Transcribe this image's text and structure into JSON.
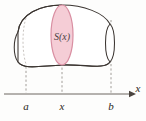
{
  "figure": {
    "type": "solid-cross-section-diagram",
    "caption_labels": {
      "cross_section": "S(x)",
      "axis": "x"
    },
    "axis": {
      "name": "x-axis",
      "label": "x",
      "tick_labels": [
        "a",
        "x",
        "b"
      ],
      "tick_positions_px": [
        26,
        62,
        111
      ],
      "y_px": 94,
      "x_start_px": 4,
      "x_end_px": 133,
      "arrow": "right-arrow"
    },
    "solid": {
      "name": "solid-body",
      "outline_color": "#3b3531",
      "fill_color": "#ffffff",
      "left_cap_hidden": true,
      "right_cap_visible": true
    },
    "cross_section": {
      "name": "cross-section-slice",
      "label": "S(x)",
      "fill_color": "#f5cdd6",
      "stroke_color": "#d98fa2",
      "center_x_px": 62,
      "center_y_px": 42,
      "rx_px": 11,
      "ry_px": 38
    },
    "guide_lines": {
      "name": "dashed-projection-lines",
      "color": "#8c8681",
      "style": "dashed",
      "count": 3
    }
  }
}
